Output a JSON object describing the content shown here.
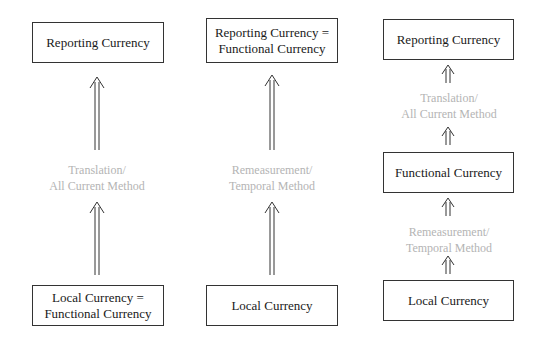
{
  "columns": [
    {
      "top_box": "Reporting Currency",
      "method_label": [
        "Translation/",
        "All Current Method"
      ],
      "bottom_box": [
        "Local Currency =",
        "Functional Currency"
      ]
    },
    {
      "top_box": [
        "Reporting Currency =",
        "Functional Currency"
      ],
      "method_label": [
        "Remeasurement/",
        "Temporal Method"
      ],
      "bottom_box": "Local Currency"
    },
    {
      "top_box": "Reporting Currency",
      "upper_method_label": [
        "Translation/",
        "All Current Method"
      ],
      "middle_box": "Functional Currency",
      "lower_method_label": [
        "Remeasurement/",
        "Temporal Method"
      ],
      "bottom_box": "Local Currency"
    }
  ]
}
